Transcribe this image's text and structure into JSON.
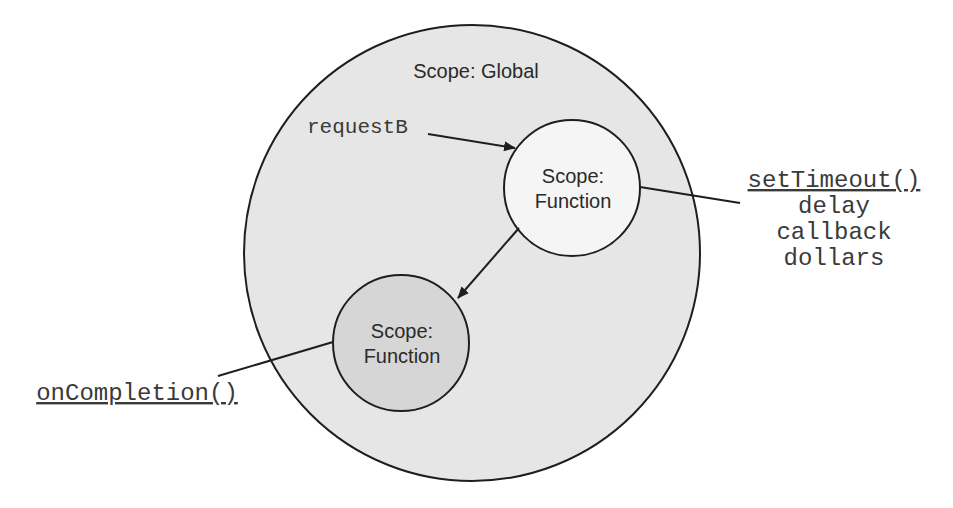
{
  "colors": {
    "background": "#ffffff",
    "stroke": "#1e1e1e",
    "global_fill": "#e6e6e6",
    "function_a_fill": "#f5f5f5",
    "function_b_fill": "#d6d6d6",
    "text": "#2a2a2a",
    "code_text": "#3a3a3a"
  },
  "global_scope": {
    "label": "Scope: Global"
  },
  "function_scope_a": {
    "line1": "Scope:",
    "line2": "Function"
  },
  "function_scope_b": {
    "line1": "Scope:",
    "line2": "Function"
  },
  "variable_label": "requestB",
  "set_timeout": {
    "name": "setTimeout()",
    "params": [
      "delay",
      "callback",
      "dollars"
    ]
  },
  "on_completion": {
    "name": "onCompletion()"
  }
}
